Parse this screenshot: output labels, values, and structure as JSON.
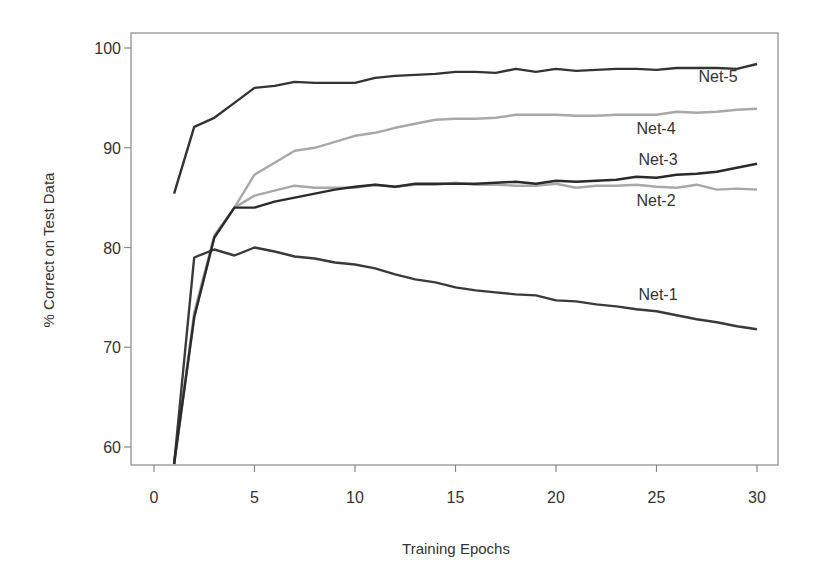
{
  "chart_data": {
    "type": "line",
    "title": "",
    "xlabel": "Training Epochs",
    "ylabel": "% Correct on Test Data",
    "xlim": [
      -1.1,
      31
    ],
    "ylim": [
      58.3,
      101.5
    ],
    "xticks": [
      0,
      5,
      10,
      15,
      20,
      25,
      30
    ],
    "yticks": [
      60,
      70,
      80,
      90,
      100
    ],
    "grid": false,
    "legend": "inline labels near line ends",
    "x": [
      1,
      2,
      3,
      4,
      5,
      6,
      7,
      8,
      9,
      10,
      11,
      12,
      13,
      14,
      15,
      16,
      17,
      18,
      19,
      20,
      21,
      22,
      23,
      24,
      25,
      26,
      27,
      28,
      29,
      30
    ],
    "series": [
      {
        "name": "Net-1",
        "color": "#3a3a3a",
        "values": [
          58.3,
          79.0,
          79.8,
          79.2,
          80.0,
          79.6,
          79.1,
          78.9,
          78.5,
          78.3,
          77.9,
          77.3,
          76.8,
          76.5,
          76.0,
          75.7,
          75.5,
          75.3,
          75.2,
          74.7,
          74.6,
          74.3,
          74.1,
          73.8,
          73.6,
          73.2,
          72.8,
          72.5,
          72.1,
          71.8
        ],
        "label_pos": {
          "x": 658,
          "y": 300
        }
      },
      {
        "name": "Net-2",
        "color": "#a8a8a8",
        "values": [
          58.3,
          73.0,
          81.0,
          84.0,
          85.2,
          85.7,
          86.2,
          86.0,
          86.0,
          86.0,
          86.3,
          86.1,
          86.3,
          86.3,
          86.5,
          86.3,
          86.3,
          86.2,
          86.2,
          86.4,
          86.0,
          86.2,
          86.2,
          86.3,
          86.1,
          86.0,
          86.3,
          85.8,
          85.9,
          85.8
        ],
        "label_pos": {
          "x": 656,
          "y": 206
        }
      },
      {
        "name": "Net-3",
        "color": "#2a2a2a",
        "values": [
          58.3,
          73.0,
          81.0,
          84.0,
          84.0,
          84.6,
          85.0,
          85.4,
          85.8,
          86.1,
          86.3,
          86.1,
          86.4,
          86.4,
          86.4,
          86.4,
          86.5,
          86.6,
          86.4,
          86.7,
          86.6,
          86.7,
          86.8,
          87.1,
          87.0,
          87.3,
          87.4,
          87.6,
          88.0,
          88.4
        ],
        "label_pos": {
          "x": 658,
          "y": 165
        }
      },
      {
        "name": "Net-4",
        "color": "#a8a8a8",
        "values": [
          58.3,
          73.5,
          81.2,
          84.0,
          87.3,
          88.5,
          89.7,
          90.0,
          90.6,
          91.2,
          91.5,
          92.0,
          92.4,
          92.8,
          92.9,
          92.9,
          93.0,
          93.3,
          93.3,
          93.3,
          93.2,
          93.2,
          93.3,
          93.3,
          93.3,
          93.6,
          93.5,
          93.6,
          93.8,
          93.9
        ],
        "label_pos": {
          "x": 656,
          "y": 134
        }
      },
      {
        "name": "Net-5",
        "color": "#333333",
        "values": [
          85.4,
          92.1,
          93.0,
          94.5,
          96.0,
          96.2,
          96.6,
          96.5,
          96.5,
          96.5,
          97.0,
          97.2,
          97.3,
          97.4,
          97.6,
          97.6,
          97.5,
          97.9,
          97.6,
          97.9,
          97.7,
          97.8,
          97.9,
          97.9,
          97.8,
          98.0,
          98.0,
          98.0,
          97.9,
          98.4
        ],
        "label_pos": {
          "x": 718,
          "y": 82
        }
      }
    ]
  }
}
